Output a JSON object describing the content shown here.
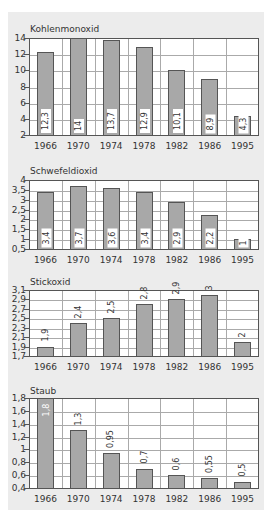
{
  "chart_data": [
    {
      "type": "bar",
      "title": "Kohlenmonoxid",
      "categories": [
        "1966",
        "1970",
        "1974",
        "1978",
        "1982",
        "1986",
        "1995"
      ],
      "values": [
        12.3,
        14,
        13.7,
        12.9,
        10.1,
        8.9,
        4.3
      ],
      "value_labels": [
        "12,3",
        "14",
        "13,7",
        "12,9",
        "10,1",
        "8,9",
        "4,3"
      ],
      "yticks": [
        "2",
        "4",
        "6",
        "8",
        "10",
        "12",
        "14"
      ],
      "ylim": [
        2,
        14
      ],
      "xlabel": "",
      "ylabel": "",
      "grid": true,
      "legend": "none"
    },
    {
      "type": "bar",
      "title": "Schwefeldioxid",
      "categories": [
        "1966",
        "1970",
        "1974",
        "1978",
        "1982",
        "1986",
        "1995"
      ],
      "values": [
        3.4,
        3.7,
        3.6,
        3.4,
        2.9,
        2.2,
        1
      ],
      "value_labels": [
        "3,4",
        "3,7",
        "3,6",
        "3,4",
        "2,9",
        "2,2",
        "1"
      ],
      "yticks": [
        "0,5",
        "1",
        "1,5",
        "2",
        "2,5",
        "3",
        "3,5",
        "4"
      ],
      "ylim": [
        0.5,
        4
      ],
      "xlabel": "",
      "ylabel": "",
      "grid": true,
      "legend": "none"
    },
    {
      "type": "bar",
      "title": "Stickoxid",
      "categories": [
        "1966",
        "1970",
        "1974",
        "1978",
        "1982",
        "1986",
        "1995"
      ],
      "values": [
        1.9,
        2.4,
        2.5,
        2.8,
        2.9,
        3,
        2
      ],
      "value_labels": [
        "1,9",
        "2,4",
        "2,5",
        "2,8",
        "2,9",
        "3",
        "2"
      ],
      "yticks": [
        "1,7",
        "1,9",
        "2,1",
        "2,3",
        "2,5",
        "2,7",
        "2,9",
        "3,1"
      ],
      "ylim": [
        1.7,
        3.1
      ],
      "xlabel": "",
      "ylabel": "",
      "grid": true,
      "legend": "none"
    },
    {
      "type": "bar",
      "title": "Staub",
      "categories": [
        "1966",
        "1970",
        "1974",
        "1978",
        "1982",
        "1986",
        "1995"
      ],
      "values": [
        1.8,
        1.3,
        0.95,
        0.7,
        0.6,
        0.55,
        0.5
      ],
      "value_labels": [
        "1,8",
        "1,3",
        "0,95",
        "0,7",
        "0,6",
        "0,55",
        "0,5"
      ],
      "yticks": [
        "0,4",
        "0,6",
        "0,8",
        "1",
        "1,2",
        "1,4",
        "1,6",
        "1,8"
      ],
      "ylim": [
        0.4,
        1.8
      ],
      "xlabel": "",
      "ylabel": "",
      "grid": true,
      "legend": "none"
    }
  ],
  "layout": [
    {
      "top": 38,
      "bottom": 135,
      "title_y": 24,
      "label_mode": "inside",
      "bar_offsets": [
        0,
        0,
        0,
        0,
        0,
        0,
        0
      ]
    },
    {
      "top": 180,
      "bottom": 249,
      "title_y": 166,
      "label_mode": "inside"
    },
    {
      "top": 290,
      "bottom": 356,
      "title_y": 277,
      "label_mode": "above"
    },
    {
      "top": 398,
      "bottom": 488,
      "title_y": 386,
      "label_mode": "above"
    }
  ]
}
